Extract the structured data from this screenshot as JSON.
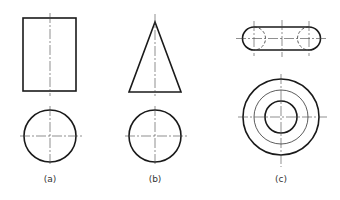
{
  "figure": {
    "views": [
      {
        "id": "a",
        "label": "(a)",
        "shape": "cylinder",
        "front_view": "rectangle",
        "top_view": "circle"
      },
      {
        "id": "b",
        "label": "(b)",
        "shape": "cone",
        "front_view": "triangle",
        "top_view": "circle"
      },
      {
        "id": "c",
        "label": "(c)",
        "shape": "torus",
        "front_view": "stadium with hidden circles",
        "top_view": "concentric circles"
      }
    ]
  },
  "colors": {
    "line": "#1a1a1a",
    "background": "#ffffff"
  }
}
